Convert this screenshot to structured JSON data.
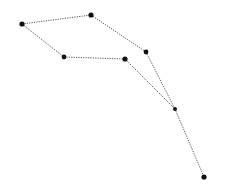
{
  "diagram": {
    "type": "point-path",
    "width": 227,
    "height": 193,
    "background": "#ffffff",
    "line_color": "#555555",
    "line_style": "dotted",
    "point_color": "#111111",
    "points": [
      {
        "id": "p1",
        "x": 22,
        "y": 24,
        "r": 2.6
      },
      {
        "id": "p2",
        "x": 91,
        "y": 15,
        "r": 2.6
      },
      {
        "id": "p3",
        "x": 146,
        "y": 52,
        "r": 2.4
      },
      {
        "id": "p4",
        "x": 175,
        "y": 109,
        "r": 2.0
      },
      {
        "id": "p5",
        "x": 204,
        "y": 177,
        "r": 2.6
      },
      {
        "id": "p6",
        "x": 64,
        "y": 57,
        "r": 2.4
      },
      {
        "id": "p7",
        "x": 125,
        "y": 59,
        "r": 2.6
      }
    ],
    "edges": [
      [
        "p1",
        "p2"
      ],
      [
        "p2",
        "p3"
      ],
      [
        "p3",
        "p4"
      ],
      [
        "p4",
        "p5"
      ],
      [
        "p1",
        "p6"
      ],
      [
        "p6",
        "p7"
      ],
      [
        "p7",
        "p4"
      ]
    ]
  }
}
